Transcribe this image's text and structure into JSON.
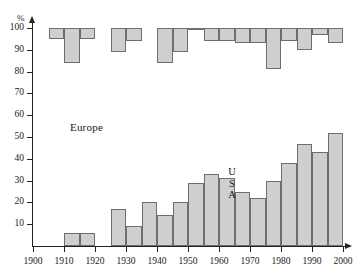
{
  "chart_data": {
    "type": "bar",
    "title": "",
    "subtitle": "",
    "xlabel": "",
    "ylabel": "%",
    "ylim": [
      0,
      100
    ],
    "xlim": [
      1900,
      2000
    ],
    "grid": false,
    "legend_position": "inline-annotation",
    "orientation": "vertical",
    "stacked": true,
    "note": "Two series plotted back-to-back in 5-year bins: Europe measured downward from 100%, USA measured upward from 0%.",
    "bin_width_years": 5,
    "x_tick_labels": [
      "1900",
      "1910",
      "1920",
      "1930",
      "1940",
      "1950",
      "1960",
      "1970",
      "1980",
      "1990",
      "2000"
    ],
    "y_tick_labels": [
      "0",
      "10",
      "20",
      "30",
      "40",
      "50",
      "60",
      "70",
      "80",
      "90",
      "100"
    ],
    "y_ticks": [
      0,
      10,
      20,
      30,
      40,
      50,
      60,
      70,
      80,
      90,
      100
    ],
    "x_ticks": [
      1900,
      1910,
      1920,
      1930,
      1940,
      1950,
      1960,
      1970,
      1980,
      1990,
      2000
    ],
    "bins": [
      "1900",
      "1905",
      "1910",
      "1915",
      "1920",
      "1925",
      "1930",
      "1935",
      "1940",
      "1945",
      "1950",
      "1955",
      "1960",
      "1965",
      "1970",
      "1975",
      "1980",
      "1985",
      "1990",
      "1995"
    ],
    "series": [
      {
        "name": "Europe",
        "color": "#cfcfcf",
        "edge_color": "#6e6e6e",
        "baseline": 100,
        "values": [
          null,
          95,
          84,
          95,
          null,
          89,
          94,
          null,
          84,
          89,
          100,
          94,
          94,
          93,
          93,
          81,
          94,
          90,
          97,
          93
        ]
      },
      {
        "name": "USA",
        "color": "#cfcfcf",
        "edge_color": "#6e6e6e",
        "baseline": 0,
        "values": [
          null,
          null,
          6,
          6,
          null,
          17,
          9,
          20,
          14,
          20,
          29,
          33,
          31,
          25,
          22,
          30,
          38,
          47,
          43,
          52,
          58,
          54
        ]
      }
    ],
    "annotations": [
      {
        "text": "Europe",
        "x": 1920,
        "y": 55,
        "name": "europe-region-label"
      },
      {
        "text": "USA",
        "x": 1968,
        "y": 30,
        "name": "usa-region-label",
        "orientation": "vertical"
      }
    ]
  },
  "axes": {
    "y_unit_label": "%",
    "y_ticks": [
      {
        "value": 100,
        "label": "100"
      },
      {
        "value": 90,
        "label": "90"
      },
      {
        "value": 80,
        "label": "80"
      },
      {
        "value": 70,
        "label": "70"
      },
      {
        "value": 60,
        "label": "60"
      },
      {
        "value": 50,
        "label": "50"
      },
      {
        "value": 40,
        "label": "40"
      },
      {
        "value": 30,
        "label": "30"
      },
      {
        "value": 20,
        "label": "20"
      },
      {
        "value": 10,
        "label": "10"
      }
    ],
    "x_ticks": [
      {
        "value": 1900,
        "label": "1900"
      },
      {
        "value": 1910,
        "label": "1910"
      },
      {
        "value": 1920,
        "label": "1920"
      },
      {
        "value": 1930,
        "label": "1930"
      },
      {
        "value": 1940,
        "label": "1940"
      },
      {
        "value": 1950,
        "label": "1950"
      },
      {
        "value": 1960,
        "label": "1960"
      },
      {
        "value": 1970,
        "label": "1970"
      },
      {
        "value": 1980,
        "label": "1980"
      },
      {
        "value": 1990,
        "label": "1990"
      },
      {
        "value": 2000,
        "label": "2000"
      }
    ]
  },
  "labels": {
    "europe": "Europe",
    "usa_letters": [
      "U",
      "S",
      "A"
    ]
  }
}
